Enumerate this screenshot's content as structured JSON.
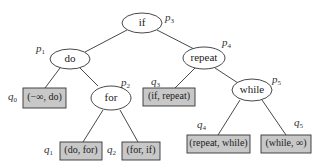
{
  "diagram": {
    "type": "binary-search-tree",
    "nodes": [
      {
        "id": "if",
        "label": "if",
        "tag": "p",
        "sub": "3"
      },
      {
        "id": "do",
        "label": "do",
        "tag": "p",
        "sub": "1"
      },
      {
        "id": "for",
        "label": "for",
        "tag": "p",
        "sub": "2"
      },
      {
        "id": "repeat",
        "label": "repeat",
        "tag": "p",
        "sub": "4"
      },
      {
        "id": "while",
        "label": "while",
        "tag": "p",
        "sub": "5"
      }
    ],
    "leaves": [
      {
        "id": "q0",
        "label": "(−∞, do)",
        "tag": "q",
        "sub": "0"
      },
      {
        "id": "q1",
        "label": "(do, for)",
        "tag": "q",
        "sub": "1"
      },
      {
        "id": "q2",
        "label": "(for, if)",
        "tag": "q",
        "sub": "2"
      },
      {
        "id": "q3",
        "label": "(if, repeat)",
        "tag": "q",
        "sub": "3"
      },
      {
        "id": "q4",
        "label": "(repeat, while)",
        "tag": "q",
        "sub": "4"
      },
      {
        "id": "q5",
        "label": "(while, ∞)",
        "tag": "q",
        "sub": "5"
      }
    ],
    "edges": [
      [
        "if",
        "do"
      ],
      [
        "if",
        "repeat"
      ],
      [
        "do",
        "q0"
      ],
      [
        "do",
        "for"
      ],
      [
        "for",
        "q1"
      ],
      [
        "for",
        "q2"
      ],
      [
        "repeat",
        "q3"
      ],
      [
        "repeat",
        "while"
      ],
      [
        "while",
        "q4"
      ],
      [
        "while",
        "q5"
      ]
    ]
  }
}
